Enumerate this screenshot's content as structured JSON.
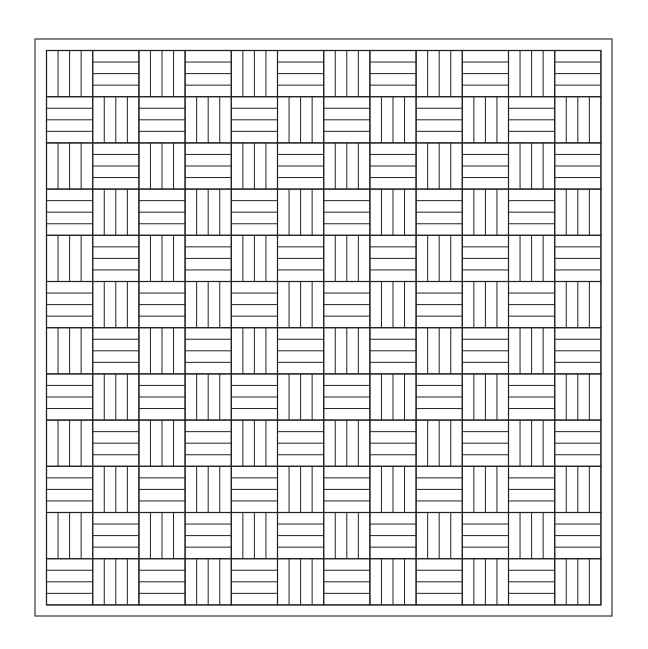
{
  "diagram": {
    "type": "basket-weave parquet pattern",
    "colors": {
      "background": "#ffffff",
      "line": "#222222",
      "frame": "#444444"
    },
    "frame": {
      "x": 35,
      "y": 39,
      "width": 577,
      "height": 577,
      "border_strip": 11.5
    },
    "grid": {
      "rows": 12,
      "cols": 12,
      "tile_size": 46.2,
      "planks_per_tile": 4
    },
    "rule": "tile (row+col) even = vertical planks, odd = horizontal planks"
  }
}
